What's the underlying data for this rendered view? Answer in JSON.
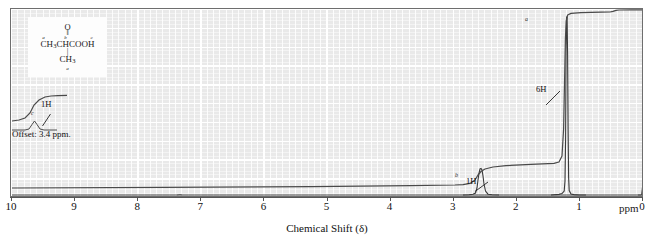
{
  "figure": {
    "type": "nmr-spectrum",
    "xcaption": "Chemical Shift (δ)",
    "ppm_unit": "ppm",
    "offset_note": "Offset: 3.4 ppm."
  },
  "structure": {
    "oxygen": "O",
    "double_bond": "‖",
    "main_line": "CH3CHCOOH",
    "main_line_display": "CH",
    "main_sub": "3",
    "main_rest": "CHCOOH",
    "bond": "|",
    "methyl": "CH",
    "methyl_sub": "3",
    "label_a_top": "a",
    "label_b_top": "b",
    "label_c_top": "c",
    "label_a_bottom": "a"
  },
  "annotations": {
    "integral_offset": "1H",
    "integral_main": "6H",
    "integral_methine": "1H",
    "peak_label_c": "c",
    "peak_label_b": "b",
    "peak_label_a": "a"
  },
  "axis": {
    "labels": [
      "10",
      "9",
      "8",
      "7",
      "6",
      "5",
      "4",
      "3",
      "2",
      "1",
      "0"
    ],
    "min_ppm": 0,
    "max_ppm": 10,
    "reversed": true,
    "grid": true
  },
  "colors": {
    "plot_background": "#e9e9e9",
    "grid_line": "#ffffff",
    "trace": "#3a3a3a",
    "frame": "#6e6e6e",
    "text": "#111111"
  },
  "chart_data": {
    "type": "line",
    "title": "",
    "xlabel": "Chemical Shift (δ)",
    "ylabel": "",
    "xlim": [
      10,
      0
    ],
    "ylim": [
      0,
      1
    ],
    "grid": true,
    "legend": "none",
    "series": [
      {
        "name": "spectrum",
        "peaks": [
          {
            "ppm": 1.2,
            "relative_height": 0.93,
            "assignment": "a",
            "protons": 6,
            "multiplicity": "doublet"
          },
          {
            "ppm": 2.55,
            "relative_height": 0.09,
            "assignment": "b",
            "protons": 1,
            "multiplicity": "septet"
          },
          {
            "ppm": 11.4,
            "relative_height": 0.06,
            "assignment": "c",
            "protons": 1,
            "multiplicity": "singlet",
            "note": "shown on 3.4 ppm offset trace"
          },
          {
            "ppm": 0.0,
            "relative_height": 0.03,
            "assignment": "TMS",
            "protons": 0,
            "multiplicity": "singlet"
          }
        ]
      },
      {
        "name": "integral",
        "steps": [
          {
            "ppm": 2.55,
            "height": 1,
            "label": "1H"
          },
          {
            "ppm": 1.2,
            "height": 6,
            "label": "6H"
          },
          {
            "ppm": 0.0,
            "height": 0,
            "label": ""
          }
        ]
      },
      {
        "name": "integral_offset_trace",
        "steps": [
          {
            "ppm": 9.8,
            "height": 1,
            "label": "1H"
          }
        ]
      }
    ],
    "tick_labels": [
      "10",
      "9",
      "8",
      "7",
      "6",
      "5",
      "4",
      "3",
      "2",
      "1",
      "0"
    ]
  }
}
